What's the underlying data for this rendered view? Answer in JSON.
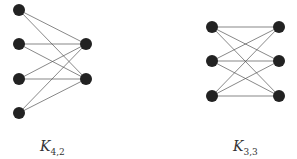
{
  "graphs": [
    {
      "name": "K4,2",
      "label_main": "K",
      "label_sub": "4,2",
      "left_nodes": [
        [
          19,
          10
        ],
        [
          19,
          44
        ],
        [
          19,
          79
        ],
        [
          19,
          113
        ]
      ],
      "right_nodes": [
        [
          86,
          44
        ],
        [
          86,
          79
        ]
      ]
    },
    {
      "name": "K3,3",
      "label_main": "K",
      "label_sub": "3,3",
      "left_nodes": [
        [
          212,
          27
        ],
        [
          212,
          61
        ],
        [
          212,
          96
        ]
      ],
      "right_nodes": [
        [
          279,
          27
        ],
        [
          279,
          61
        ],
        [
          279,
          96
        ]
      ]
    }
  ],
  "style": {
    "node_color": "#222222",
    "edge_color": "#555555",
    "node_radius": 6
  }
}
